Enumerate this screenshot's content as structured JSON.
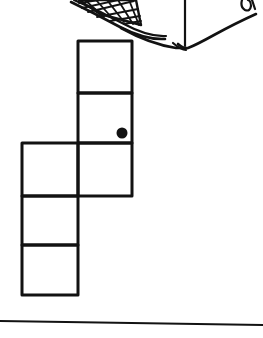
{
  "figure": {
    "background_color": "#ffffff",
    "ink_color": "#121212",
    "width": 263,
    "height": 338,
    "net": {
      "label": "square-grid-net",
      "cell_size_w": 54,
      "cell_size_h": 51,
      "stroke_width": 3,
      "squares": [
        {
          "name": "square-right-top",
          "x": 78,
          "y": 41,
          "w": 54,
          "h": 52
        },
        {
          "name": "square-right-middle",
          "x": 78,
          "y": 93,
          "w": 54,
          "h": 50
        },
        {
          "name": "square-right-bottom",
          "x": 78,
          "y": 143,
          "w": 54,
          "h": 53
        },
        {
          "name": "square-left-top",
          "x": 22,
          "y": 143,
          "w": 56,
          "h": 53
        },
        {
          "name": "square-left-middle",
          "x": 22,
          "y": 196,
          "w": 56,
          "h": 49
        },
        {
          "name": "square-left-bottom",
          "x": 22,
          "y": 245,
          "w": 56,
          "h": 50
        }
      ]
    },
    "marker_dot": {
      "label": "black-dot-marker",
      "cx": 122,
      "cy": 133,
      "r": 5.5,
      "color": "#121212"
    },
    "ground_line": {
      "label": "ground-line",
      "x1": 0,
      "y1": 321,
      "x2": 263,
      "y2": 325,
      "stroke_width": 2
    },
    "container": {
      "label": "mesh-basket-bottom",
      "mesh_panel": {
        "label": "crosshatch-mesh-panel",
        "rows": 3,
        "columns": 5
      },
      "has_center_vertical_line": true,
      "has_v_bottom": true,
      "has_right_curl_mark": true
    }
  }
}
